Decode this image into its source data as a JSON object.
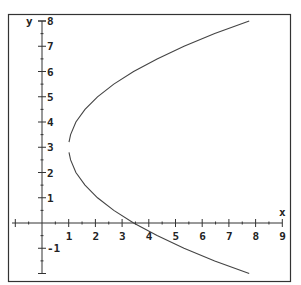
{
  "chart_data": {
    "type": "line",
    "title": "",
    "xlabel": "x",
    "ylabel": "y",
    "xlim": [
      -1,
      9
    ],
    "ylim": [
      -2,
      8
    ],
    "grid": false,
    "legend": null,
    "x_ticks": [
      1,
      2,
      3,
      4,
      5,
      6,
      7,
      8,
      9
    ],
    "y_ticks": [
      -1,
      1,
      2,
      3,
      4,
      5,
      6,
      7,
      8
    ],
    "series": [
      {
        "name": "upper branch",
        "description": "x = 1 + (y-3)^2 / 3.7, y from 3.2 to 8",
        "points": [
          [
            1.01,
            3.2
          ],
          [
            1.07,
            3.5
          ],
          [
            1.27,
            4.0
          ],
          [
            1.61,
            4.5
          ],
          [
            2.08,
            5.0
          ],
          [
            2.69,
            5.5
          ],
          [
            3.43,
            6.0
          ],
          [
            4.31,
            6.5
          ],
          [
            5.32,
            7.0
          ],
          [
            6.47,
            7.5
          ],
          [
            7.76,
            8.0
          ]
        ]
      },
      {
        "name": "lower branch",
        "description": "x = 1 + (y-3)^2 / 3.7, y from 2.8 to -2",
        "points": [
          [
            1.01,
            2.8
          ],
          [
            1.07,
            2.5
          ],
          [
            1.27,
            2.0
          ],
          [
            1.61,
            1.5
          ],
          [
            2.08,
            1.0
          ],
          [
            2.69,
            0.5
          ],
          [
            3.43,
            0.0
          ],
          [
            4.31,
            -0.5
          ],
          [
            5.32,
            -1.0
          ],
          [
            6.47,
            -1.5
          ],
          [
            7.76,
            -2.0
          ]
        ]
      }
    ]
  },
  "axes": {
    "x_label": "x",
    "y_label": "y",
    "x_tick_labels": [
      "1",
      "2",
      "3",
      "4",
      "5",
      "6",
      "7",
      "8",
      "9"
    ],
    "y_tick_labels": [
      "-1",
      "1",
      "2",
      "3",
      "4",
      "5",
      "6",
      "7",
      "8"
    ]
  }
}
